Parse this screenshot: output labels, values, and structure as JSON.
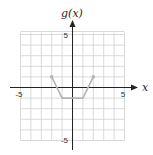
{
  "chart_data": {
    "type": "line",
    "title": "",
    "xlabel": "x",
    "ylabel": "g(x)",
    "xlim": [
      -5,
      5
    ],
    "ylim": [
      -5,
      5
    ],
    "grid": true,
    "tick_labels": {
      "x": [
        "-5",
        "5"
      ],
      "y": [
        "5",
        "-5"
      ]
    },
    "series": [
      {
        "name": "g(x)",
        "points": [
          [
            -2,
            1
          ],
          [
            -1,
            -1
          ],
          [
            1,
            -1
          ],
          [
            2,
            1
          ]
        ],
        "endpoints": "dots",
        "color": "#b5b5b5"
      }
    ]
  },
  "colors": {
    "grid": "#cfcfcf",
    "axis": "#222222",
    "curve": "#b5b5b5"
  }
}
